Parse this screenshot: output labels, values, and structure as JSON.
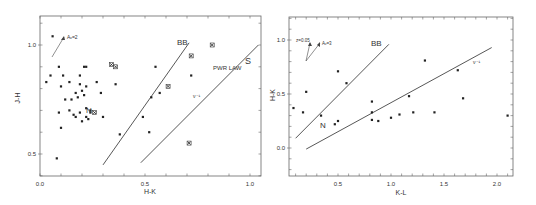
{
  "chart_data": [
    {
      "type": "scatter",
      "title": "",
      "xlabel": "H-K",
      "ylabel": "J-H",
      "xlim": [
        0.0,
        1.05
      ],
      "ylim": [
        0.4,
        1.13
      ],
      "xticks": [
        "0.0",
        "0.5",
        "1.0"
      ],
      "yticks": [
        "0.5",
        "1.0"
      ],
      "grid": false,
      "px": {
        "x0": 40,
        "x1": 250,
        "xv0": 0.0,
        "xv1": 1.0,
        "y0": 154,
        "y1": 45,
        "yv0": 0.5,
        "yv1": 1.0
      },
      "frame": {
        "left": 40,
        "top": 16,
        "right": 261,
        "bottom": 176
      },
      "series": [
        {
          "name": "dots",
          "marker": "dot",
          "points": [
            [
              0.06,
              1.04
            ],
            [
              0.09,
              0.9
            ],
            [
              0.05,
              0.86
            ],
            [
              0.03,
              0.83
            ],
            [
              0.11,
              0.86
            ],
            [
              0.14,
              0.83
            ],
            [
              0.19,
              0.86
            ],
            [
              0.21,
              0.9
            ],
            [
              0.22,
              0.9
            ],
            [
              0.1,
              0.81
            ],
            [
              0.19,
              0.82
            ],
            [
              0.22,
              0.81
            ],
            [
              0.27,
              0.83
            ],
            [
              0.17,
              0.78
            ],
            [
              0.2,
              0.79
            ],
            [
              0.21,
              0.77
            ],
            [
              0.29,
              0.78
            ],
            [
              0.12,
              0.75
            ],
            [
              0.15,
              0.75
            ],
            [
              0.18,
              0.76
            ],
            [
              0.09,
              0.69
            ],
            [
              0.14,
              0.7
            ],
            [
              0.16,
              0.68
            ],
            [
              0.19,
              0.69
            ],
            [
              0.22,
              0.71
            ],
            [
              0.24,
              0.7
            ],
            [
              0.22,
              0.67
            ],
            [
              0.17,
              0.67
            ],
            [
              0.24,
              0.69
            ],
            [
              0.3,
              0.67
            ],
            [
              0.2,
              0.65
            ],
            [
              0.23,
              0.66
            ],
            [
              0.1,
              0.62
            ],
            [
              0.08,
              0.48
            ],
            [
              0.38,
              0.59
            ],
            [
              0.36,
              0.82
            ],
            [
              0.55,
              0.9
            ],
            [
              0.53,
              0.76
            ],
            [
              0.57,
              0.78
            ],
            [
              0.49,
              0.67
            ],
            [
              0.52,
              0.6
            ],
            [
              0.72,
              0.86
            ]
          ]
        },
        {
          "name": "crosses",
          "marker": "x",
          "points": [
            [
              0.34,
              0.91
            ],
            [
              0.36,
              0.9
            ],
            [
              0.26,
              0.69
            ],
            [
              0.61,
              0.81
            ],
            [
              0.72,
              0.95
            ],
            [
              0.82,
              1.0
            ],
            [
              0.71,
              0.55
            ]
          ]
        }
      ],
      "lines": [
        {
          "label": "BB",
          "from": [
            0.3,
            0.45
          ],
          "to": [
            0.71,
            1.01
          ]
        },
        {
          "label": "PWR LAW",
          "sublabel": "ν⁻¹",
          "from": [
            0.48,
            0.46
          ],
          "to": [
            1.04,
            1.0
          ]
        }
      ],
      "annotations": [
        {
          "text": "N",
          "at": [
            0.23,
            0.74
          ]
        },
        {
          "text": "BB",
          "at": [
            0.66,
            1.02
          ]
        },
        {
          "text": "PWR LAW",
          "at": [
            0.82,
            0.91
          ]
        },
        {
          "text": "S",
          "at": [
            0.98,
            0.95
          ]
        },
        {
          "text": "ν⁻¹",
          "at": [
            0.74,
            0.78
          ]
        },
        {
          "text": "A_V=2",
          "at": [
            0.13,
            1.04
          ]
        }
      ],
      "reddening_vector": {
        "label": "A_V=2",
        "from": [
          0.06,
          0.94
        ],
        "to": [
          0.12,
          1.04
        ]
      }
    },
    {
      "type": "scatter",
      "title": "",
      "xlabel": "K-L",
      "ylabel": "H-K",
      "xlim": [
        0.05,
        2.15
      ],
      "ylim": [
        -0.25,
        1.2
      ],
      "xticks": [
        "0.5",
        "1.0",
        "1.5",
        "2.0"
      ],
      "yticks": [
        "0.0",
        "0.5",
        "1.0"
      ],
      "grid": false,
      "px": {
        "x0": 338,
        "x1": 497,
        "xv0": 0.5,
        "xv1": 2.0,
        "y0": 148,
        "y1": 40,
        "yv0": 0.0,
        "yv1": 1.0
      },
      "frame": {
        "left": 289,
        "top": 17,
        "right": 513,
        "bottom": 176
      },
      "series": [
        {
          "name": "dots",
          "marker": "dot",
          "points": [
            [
              0.08,
              0.37
            ],
            [
              0.17,
              0.33
            ],
            [
              0.2,
              0.52
            ],
            [
              0.34,
              0.3
            ],
            [
              0.5,
              0.71
            ],
            [
              0.58,
              0.6
            ],
            [
              0.47,
              0.22
            ],
            [
              0.5,
              0.25
            ],
            [
              0.82,
              0.43
            ],
            [
              0.82,
              0.33
            ],
            [
              0.82,
              0.26
            ],
            [
              0.88,
              0.25
            ],
            [
              1.0,
              0.28
            ],
            [
              1.08,
              0.31
            ],
            [
              1.17,
              0.48
            ],
            [
              1.21,
              0.33
            ],
            [
              1.32,
              0.81
            ],
            [
              1.41,
              0.33
            ],
            [
              1.63,
              0.72
            ],
            [
              1.68,
              0.46
            ],
            [
              2.1,
              0.3
            ]
          ]
        }
      ],
      "lines": [
        {
          "label": "BB",
          "from": [
            0.1,
            0.09
          ],
          "to": [
            0.98,
            0.96
          ]
        },
        {
          "label": "ν⁻¹",
          "from": [
            0.2,
            -0.01
          ],
          "to": [
            1.95,
            0.93
          ]
        }
      ],
      "annotations": [
        {
          "text": "N",
          "at": [
            0.28,
            0.19
          ]
        },
        {
          "text": "BB",
          "at": [
            0.33,
            0.97
          ]
        },
        {
          "text": "ν⁻¹",
          "at": [
            1.8,
            0.8
          ]
        },
        {
          "text": "z=0.05",
          "at": [
            0.13,
            0.99
          ]
        },
        {
          "text": "A_V=3",
          "at": [
            0.3,
            0.96
          ]
        }
      ],
      "reddening_vectors": [
        {
          "label": "z=0.05",
          "from": [
            0.2,
            0.8
          ],
          "to": [
            0.23,
            0.96
          ]
        },
        {
          "label": "A_V=3",
          "from": [
            0.2,
            0.8
          ],
          "to": [
            0.3,
            0.96
          ]
        }
      ]
    }
  ],
  "labels": {
    "left": {
      "xlabel": "H-K",
      "ylabel": "J-H",
      "n": "N",
      "bb": "BB",
      "pwr": "PWR LAW",
      "s": "S",
      "nu": "ν⁻¹",
      "av": "Aᵥ=2"
    },
    "right": {
      "xlabel": "K-L",
      "ylabel": "H-K",
      "n": "N",
      "bb": "BB",
      "nu": "ν⁻¹",
      "z": "z=0.05",
      "av": "Aᵥ=3"
    }
  }
}
